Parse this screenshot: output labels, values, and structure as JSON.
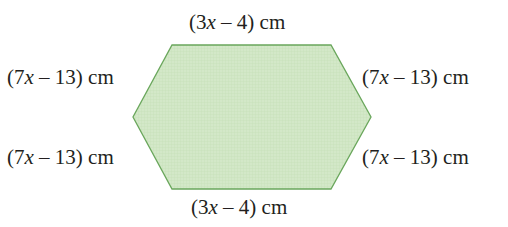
{
  "figure": {
    "shape": "hexagon",
    "fill_color": "#cfe6c4",
    "stroke_color": "#6aa75c",
    "vertices": [
      [
        172,
        45
      ],
      [
        331,
        45
      ],
      [
        371,
        117
      ],
      [
        331,
        189
      ],
      [
        172,
        189
      ],
      [
        133,
        117
      ]
    ],
    "labels": {
      "top": {
        "pre": "(3",
        "var": "x",
        "post": " – 4) cm"
      },
      "bottom": {
        "pre": "(3",
        "var": "x",
        "post": " – 4) cm"
      },
      "upper_left": {
        "pre": "(7",
        "var": "x",
        "post": " – 13) cm"
      },
      "lower_left": {
        "pre": "(7",
        "var": "x",
        "post": " – 13) cm"
      },
      "upper_right": {
        "pre": "(7",
        "var": "x",
        "post": " – 13) cm"
      },
      "lower_right": {
        "pre": "(7",
        "var": "x",
        "post": " – 13) cm"
      }
    }
  }
}
